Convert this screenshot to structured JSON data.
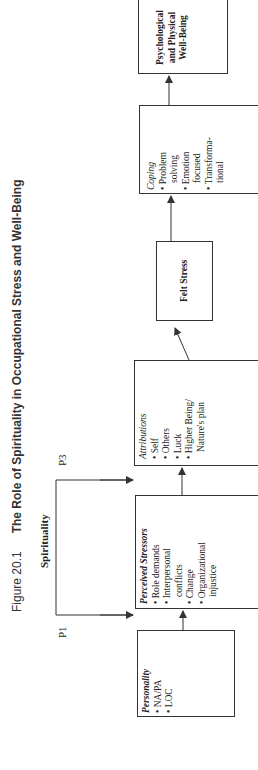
{
  "figure": {
    "number": "Figure 20.1",
    "title": "The Role of Spirituality in Occupational Stress and Well-Being"
  },
  "moderator": {
    "label": "Spirituality",
    "paths": [
      "P1",
      "P3"
    ]
  },
  "boxes": {
    "personality": {
      "title": "Personality",
      "items": [
        "NA/PA",
        "LOC"
      ]
    },
    "perceived_stressors": {
      "title": "Perceived Stressors",
      "items": [
        "Role demands",
        "Interpersonal",
        "conflicts",
        "Change",
        "Organizational",
        "injustice"
      ]
    },
    "attributions": {
      "title": "Attributions",
      "items": [
        "Self",
        "Others",
        "Luck",
        "Higher Being/",
        "Nature's plan"
      ]
    },
    "felt_stress": {
      "title": "Felt Stress"
    },
    "coping": {
      "title": "Coping",
      "items": [
        "Problem",
        "solving",
        "Emotion",
        "focused",
        "Transforma-",
        "tional"
      ]
    },
    "well_being": {
      "lines": [
        "Psychological",
        "and Physical",
        "Well-Being"
      ]
    }
  },
  "colors": {
    "line": "#333333",
    "text": "#222222"
  }
}
